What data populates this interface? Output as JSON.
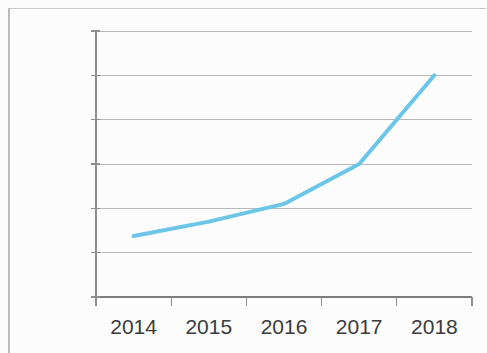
{
  "chart_data": {
    "type": "line",
    "title": "",
    "xlabel": "",
    "ylabel": "",
    "categories": [
      "2014",
      "2015",
      "2016",
      "2017",
      "2018"
    ],
    "values": [
      2750,
      3400,
      4200,
      6000,
      10000
    ],
    "series": [
      {
        "name": "",
        "values": [
          2750,
          3400,
          4200,
          6000,
          10000
        ]
      }
    ],
    "ylim": [
      0,
      12000
    ],
    "y_ticks": [
      0,
      2000,
      4000,
      6000,
      8000,
      10000,
      12000
    ],
    "y_tick_labels": [
      "0",
      "2 000",
      "4 000",
      "6 000",
      "8 000",
      "10,000",
      "12,000"
    ],
    "x_tick_labels": [
      "2014",
      "2015",
      "2016",
      "2017",
      "2018"
    ],
    "grid": "horizontal",
    "legend": "none",
    "markers": "none",
    "line_color": "#6CC6E8",
    "grid_color": "#b9b9b9",
    "axis_color": "#8f8f8f",
    "text_color": "#3b3b3b",
    "background_color": "#fdfdfd",
    "line_width": 4
  },
  "axes": {
    "y_labels": [
      {
        "text": "12,000",
        "value": 12000
      },
      {
        "text": "10,000",
        "value": 10000
      },
      {
        "text": "8 000",
        "value": 8000
      },
      {
        "text": "6 000",
        "value": 6000
      },
      {
        "text": "4 000",
        "value": 4000
      },
      {
        "text": "2 000",
        "value": 2000
      },
      {
        "text": "0",
        "value": 0
      }
    ],
    "x_labels": [
      {
        "text": "2014",
        "value": 2014
      },
      {
        "text": "2015",
        "value": 2015
      },
      {
        "text": "2016",
        "value": 2016
      },
      {
        "text": "2017",
        "value": 2017
      },
      {
        "text": "2018",
        "value": 2018
      }
    ]
  }
}
